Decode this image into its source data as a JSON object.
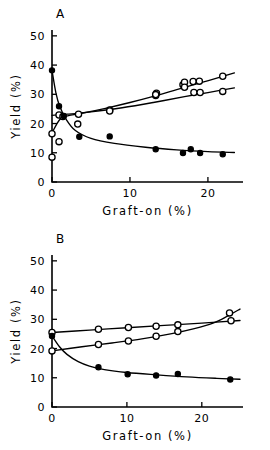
{
  "figure": {
    "title": "",
    "panels": [
      "A",
      "B"
    ]
  },
  "panel_a": {
    "letter": "A",
    "xlabel": "Graft-on (%)",
    "ylabel": "Yield (%)"
  },
  "panel_b": {
    "letter": "B",
    "xlabel": "Graft-on (%)",
    "ylabel": "Yield (%)"
  },
  "axis_text": {
    "y_0": "0",
    "y_10": "10",
    "y_20": "20",
    "y_30": "30",
    "y_40": "40",
    "y_50": "50",
    "x_0": "0",
    "x_10": "10",
    "x_20": "20"
  },
  "chart_data": [
    {
      "type": "scatter",
      "panel": "A",
      "title": "A",
      "xlabel": "Graft-on (%)",
      "ylabel": "Yield (%)",
      "xlim": [
        0,
        24.5
      ],
      "ylim": [
        0,
        52
      ],
      "xticks": [
        0,
        10,
        20
      ],
      "yticks": [
        0,
        10,
        20,
        30,
        40,
        50
      ],
      "grid": false,
      "legend": null,
      "series": [
        {
          "name": "open-circle-upper",
          "marker": "open-circle",
          "points": [
            [
              0.0,
              16.5
            ],
            [
              0.9,
              22.9
            ],
            [
              1.4,
              22.4
            ],
            [
              3.4,
              23.2
            ],
            [
              7.4,
              24.6
            ],
            [
              13.3,
              29.6
            ],
            [
              13.4,
              30.4
            ],
            [
              16.8,
              33.3
            ],
            [
              17.0,
              34.1
            ],
            [
              18.1,
              34.4
            ],
            [
              18.9,
              34.5
            ],
            [
              21.9,
              36.2
            ]
          ],
          "fit_curve": [
            [
              0.0,
              16.8
            ],
            [
              1.0,
              21.4
            ],
            [
              2.0,
              22.6
            ],
            [
              4.0,
              23.6
            ],
            [
              7.0,
              25.3
            ],
            [
              10.0,
              27.2
            ],
            [
              13.0,
              29.3
            ],
            [
              16.0,
              31.6
            ],
            [
              19.0,
              33.9
            ],
            [
              22.0,
              36.2
            ],
            [
              23.4,
              37.3
            ]
          ]
        },
        {
          "name": "open-circle-lower",
          "marker": "open-circle",
          "points": [
            [
              0.0,
              8.5
            ],
            [
              0.9,
              13.8
            ],
            [
              3.3,
              19.8
            ],
            [
              7.4,
              24.3
            ],
            [
              13.3,
              29.9
            ],
            [
              17.0,
              32.4
            ],
            [
              18.2,
              30.6
            ],
            [
              19.0,
              30.6
            ],
            [
              21.9,
              31.0
            ]
          ],
          "fit_curve": [
            [
              0.0,
              22.8
            ],
            [
              2.0,
              23.2
            ],
            [
              5.0,
              24.0
            ],
            [
              9.0,
              25.4
            ],
            [
              13.0,
              27.2
            ],
            [
              17.0,
              29.2
            ],
            [
              20.0,
              30.6
            ],
            [
              23.4,
              32.2
            ]
          ]
        },
        {
          "name": "filled-circle",
          "marker": "filled-circle",
          "points": [
            [
              0.0,
              38.2
            ],
            [
              0.9,
              25.9
            ],
            [
              1.5,
              22.6
            ],
            [
              3.5,
              15.5
            ],
            [
              7.4,
              15.6
            ],
            [
              13.3,
              11.2
            ],
            [
              16.8,
              9.9
            ],
            [
              17.8,
              11.2
            ],
            [
              19.0,
              9.9
            ],
            [
              21.9,
              9.5
            ]
          ],
          "fit_curve": [
            [
              0.0,
              38.2
            ],
            [
              0.5,
              30.5
            ],
            [
              1.0,
              25.8
            ],
            [
              1.8,
              21.5
            ],
            [
              3.0,
              17.6
            ],
            [
              5.0,
              14.9
            ],
            [
              8.0,
              13.2
            ],
            [
              12.0,
              11.9
            ],
            [
              16.0,
              11.0
            ],
            [
              20.0,
              10.4
            ],
            [
              23.4,
              10.1
            ]
          ]
        }
      ]
    },
    {
      "type": "scatter",
      "panel": "B",
      "title": "B",
      "xlabel": "Graft-on (%)",
      "ylabel": "Yield (%)",
      "xlim": [
        0,
        25.5
      ],
      "ylim": [
        0,
        52
      ],
      "xticks": [
        0,
        10,
        20
      ],
      "yticks": [
        0,
        10,
        20,
        30,
        40,
        50
      ],
      "grid": false,
      "legend": null,
      "series": [
        {
          "name": "open-circle-upper",
          "marker": "open-circle",
          "points": [
            [
              0.0,
              25.5
            ],
            [
              6.2,
              26.6
            ],
            [
              10.2,
              27.2
            ],
            [
              13.9,
              27.6
            ],
            [
              16.8,
              28.1
            ],
            [
              23.9,
              29.5
            ]
          ],
          "fit_curve": [
            [
              0.0,
              25.5
            ],
            [
              5.0,
              26.3
            ],
            [
              10.0,
              27.1
            ],
            [
              15.0,
              27.9
            ],
            [
              20.0,
              28.7
            ],
            [
              25.1,
              29.6
            ]
          ]
        },
        {
          "name": "open-circle-lower",
          "marker": "open-circle",
          "points": [
            [
              0.0,
              19.2
            ],
            [
              6.2,
              21.4
            ],
            [
              10.2,
              22.6
            ],
            [
              13.9,
              24.2
            ],
            [
              16.8,
              25.8
            ],
            [
              23.7,
              32.2
            ]
          ],
          "fit_curve": [
            [
              0.0,
              19.2
            ],
            [
              4.0,
              20.6
            ],
            [
              8.0,
              21.9
            ],
            [
              12.0,
              23.3
            ],
            [
              16.0,
              25.1
            ],
            [
              19.0,
              26.8
            ],
            [
              21.5,
              28.7
            ],
            [
              23.5,
              31.2
            ],
            [
              25.1,
              33.5
            ]
          ]
        },
        {
          "name": "filled-circle",
          "marker": "filled-circle",
          "points": [
            [
              0.0,
              24.3
            ],
            [
              6.2,
              13.6
            ],
            [
              10.1,
              11.2
            ],
            [
              13.9,
              10.8
            ],
            [
              16.8,
              11.3
            ],
            [
              23.8,
              9.4
            ]
          ],
          "fit_curve": [
            [
              0.0,
              24.3
            ],
            [
              1.0,
              20.6
            ],
            [
              2.0,
              18.0
            ],
            [
              3.5,
              15.5
            ],
            [
              5.0,
              14.0
            ],
            [
              7.0,
              12.8
            ],
            [
              10.0,
              11.8
            ],
            [
              14.0,
              11.0
            ],
            [
              18.0,
              10.3
            ],
            [
              22.0,
              9.8
            ],
            [
              25.1,
              9.5
            ]
          ]
        }
      ]
    }
  ]
}
